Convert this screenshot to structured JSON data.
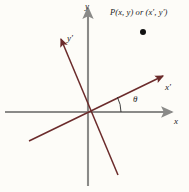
{
  "figure": {
    "background_color": "#fdfcf8",
    "axis_color_primary": "#8a8a88",
    "axis_color_rotated": "#6b2b2b",
    "point_color": "#111111",
    "labels": {
      "y_axis": "y",
      "x_axis": "x",
      "y_prime_axis": "y′",
      "x_prime_axis": "x′",
      "angle": "θ",
      "point": "P(x, y) or (x′, y′)"
    },
    "geometry": {
      "origin_x": 88,
      "origin_y": 112,
      "x_axis_start_x": 5,
      "x_axis_end_x": 172,
      "y_axis_top_y": 8,
      "y_axis_bottom_y": 186,
      "x_prime_tip_x": 163,
      "x_prime_tip_y": 76,
      "x_prime_tail_x": 29,
      "x_prime_tail_y": 141,
      "y_prime_tip_x": 61,
      "y_prime_tip_y": 39,
      "y_prime_tail_x": 118,
      "y_prime_tail_y": 175,
      "point_dot_x": 143,
      "point_dot_y": 32,
      "point_dot_radius": 3,
      "angle_arc_radius": 33,
      "angle_degrees": 26
    }
  }
}
